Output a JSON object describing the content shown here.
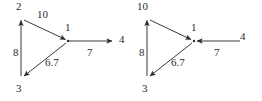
{
  "figure": {
    "kind": "directed-graph-pair",
    "background_color": "#ffffff",
    "stroke_color": "#3a3a3a",
    "text_color": "#2b2b2b"
  },
  "diagrams": [
    {
      "id": "left-graph",
      "name": "left-directed-graph",
      "nodes": [
        {
          "id": "n2",
          "label": "2",
          "x": 21,
          "y": 18,
          "label_x": 17,
          "label_y": 2
        },
        {
          "id": "n1",
          "label": "1",
          "x": 68,
          "y": 41,
          "label_x": 64,
          "label_y": 25
        },
        {
          "id": "n3",
          "label": "3",
          "x": 21,
          "y": 78,
          "label_x": 17,
          "label_y": 83
        },
        {
          "id": "n4",
          "label": "4",
          "x": 113,
          "y": 41,
          "label_x": 119,
          "label_y": 33
        }
      ],
      "edges": [
        {
          "id": "e2-1",
          "from": "n2",
          "to": "n1",
          "weight": "10",
          "label_x": 38,
          "label_y": 9,
          "arrow_at": "to"
        },
        {
          "id": "e3-2",
          "from": "n3",
          "to": "n2",
          "weight": "8",
          "label_x": 12,
          "label_y": 48,
          "arrow_at": "to"
        },
        {
          "id": "e1-3",
          "from": "n1",
          "to": "n3",
          "weight": "6.7",
          "label_x": 45,
          "label_y": 57,
          "arrow_at": "to"
        },
        {
          "id": "e1-4",
          "from": "n1",
          "to": "n4",
          "weight": "7",
          "label_x": 86,
          "label_y": 48,
          "arrow_at": "to"
        }
      ]
    },
    {
      "id": "right-graph",
      "name": "right-directed-graph",
      "nodes": [
        {
          "id": "n10",
          "label": "10",
          "x": 147,
          "y": 18,
          "label_x": 138,
          "label_y": 2
        },
        {
          "id": "n1",
          "label": "1",
          "x": 194,
          "y": 41,
          "label_x": 190,
          "label_y": 25
        },
        {
          "id": "n3",
          "label": "3",
          "x": 147,
          "y": 78,
          "label_x": 143,
          "label_y": 83
        },
        {
          "id": "n4",
          "label": "4",
          "x": 240,
          "y": 41,
          "label_x": 238,
          "label_y": 31
        }
      ],
      "edges": [
        {
          "id": "e10-1",
          "from": "n10",
          "to": "n1",
          "weight": "10",
          "label_x": 0,
          "label_y": 0,
          "arrow_at": "to",
          "hide_weight": true
        },
        {
          "id": "e3-10",
          "from": "n3",
          "to": "n10",
          "weight": "8",
          "label_x": 138,
          "label_y": 48,
          "arrow_at": "to"
        },
        {
          "id": "e1-3",
          "from": "n1",
          "to": "n3",
          "weight": "6.7",
          "label_x": 171,
          "label_y": 57,
          "arrow_at": "to"
        },
        {
          "id": "e4-1",
          "from": "n4",
          "to": "n1",
          "weight": "7",
          "label_x": 213,
          "label_y": 48,
          "arrow_at": "to"
        }
      ]
    }
  ],
  "labels": {
    "left": {
      "node_2": "2",
      "node_1": "1",
      "node_3": "3",
      "node_4": "4",
      "w_2_1": "10",
      "w_3_2": "8",
      "w_1_3": "6.7",
      "w_1_4": "7"
    },
    "right": {
      "node_10": "10",
      "node_1": "1",
      "node_3": "3",
      "node_4": "4",
      "w_3_10": "8",
      "w_1_3": "6.7",
      "w_4_1": "7"
    }
  }
}
